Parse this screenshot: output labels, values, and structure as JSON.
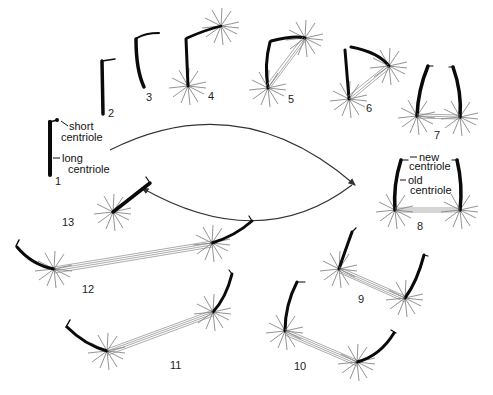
{
  "figure": {
    "stages": [
      {
        "id": 1,
        "label": "1"
      },
      {
        "id": 2,
        "label": "2"
      },
      {
        "id": 3,
        "label": "3"
      },
      {
        "id": 4,
        "label": "4"
      },
      {
        "id": 5,
        "label": "5"
      },
      {
        "id": 6,
        "label": "6"
      },
      {
        "id": 7,
        "label": "7"
      },
      {
        "id": 8,
        "label": "8"
      },
      {
        "id": 9,
        "label": "9"
      },
      {
        "id": 10,
        "label": "10"
      },
      {
        "id": 11,
        "label": "11"
      },
      {
        "id": 12,
        "label": "12"
      },
      {
        "id": 13,
        "label": "13"
      }
    ],
    "annotations": {
      "short_centriole_line1": "short",
      "short_centriole_line2": "centriole",
      "long_centriole_line1": "long",
      "long_centriole_line2": "centriole",
      "new_centriole_line1": "new",
      "new_centriole_line2": "centriole",
      "old_centriole_line1": "old",
      "old_centriole_line2": "centriole"
    },
    "colors": {
      "centriole": "#0a0a0a",
      "aster_rays": "#777777",
      "spindle_fibers": "#888888",
      "background": "#ffffff"
    }
  }
}
